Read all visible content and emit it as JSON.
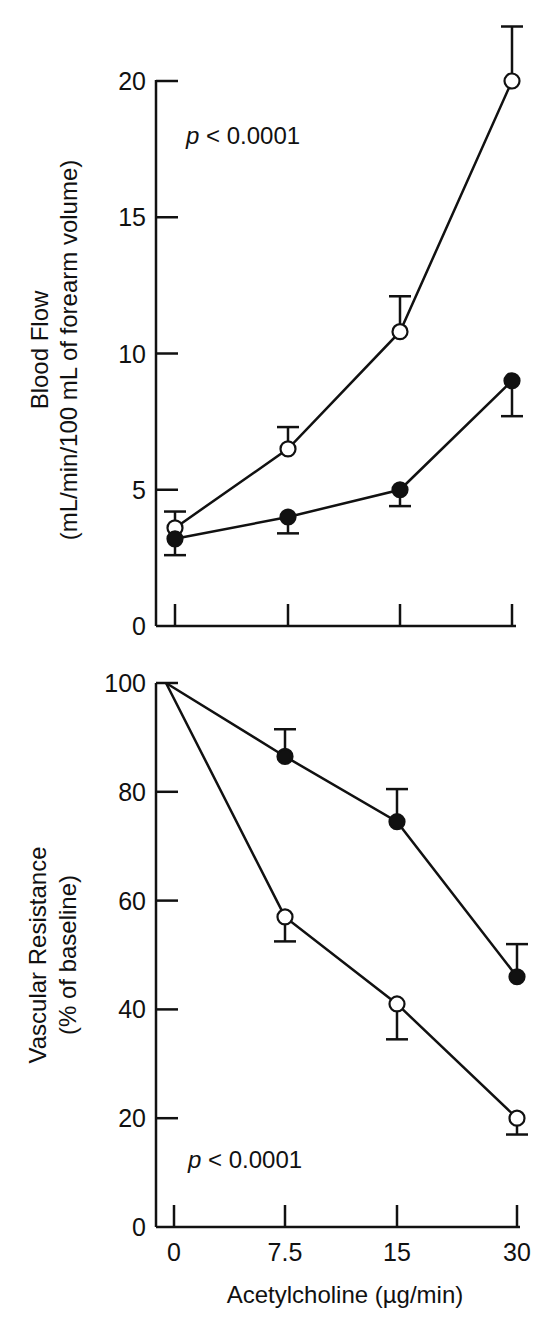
{
  "chart_data": [
    {
      "type": "line",
      "title": "",
      "xlabel": "",
      "ylabel": "Blood Flow (mL/min/100 mL of forearm volume)",
      "ylabel_line1": "Blood Flow",
      "ylabel_line2": "(mL/min/100 mL of forearm volume)",
      "categories": [
        "0",
        "7.5",
        "15",
        "30"
      ],
      "yticks": [
        "0",
        "5",
        "10",
        "15",
        "20"
      ],
      "ylim": [
        0,
        20
      ],
      "grid": false,
      "annotation": "p < 0.0001",
      "annotation_p": "p",
      "annotation_rest": " < 0.0001",
      "series": [
        {
          "name": "open circles",
          "marker": "open",
          "values": [
            3.6,
            6.5,
            10.8,
            20.0
          ],
          "error_upper": [
            4.2,
            7.3,
            12.1,
            22.0
          ]
        },
        {
          "name": "filled circles",
          "marker": "filled",
          "values": [
            3.2,
            4.0,
            5.0,
            9.0
          ],
          "error_lower": [
            2.6,
            3.4,
            4.4,
            7.7
          ]
        }
      ]
    },
    {
      "type": "line",
      "title": "",
      "xlabel": "Acetylcholine (µg/min)",
      "ylabel": "Vascular Resistance (% of baseline)",
      "ylabel_line1": "Vascular Resistance",
      "ylabel_line2": "(% of baseline)",
      "categories": [
        "0",
        "7.5",
        "15",
        "30"
      ],
      "yticks": [
        "0",
        "20",
        "40",
        "60",
        "80",
        "100"
      ],
      "ylim": [
        0,
        100
      ],
      "grid": false,
      "annotation": "p < 0.0001",
      "annotation_p": "p",
      "annotation_rest": " < 0.0001",
      "series": [
        {
          "name": "filled circles",
          "marker": "filled",
          "values": [
            100,
            86.5,
            74.5,
            46.0
          ],
          "error_upper": [
            null,
            91.5,
            80.5,
            52.0
          ]
        },
        {
          "name": "open circles",
          "marker": "open",
          "values": [
            100,
            57.0,
            41.0,
            20.0
          ],
          "error_lower": [
            null,
            52.5,
            34.5,
            17.0
          ]
        }
      ]
    }
  ]
}
